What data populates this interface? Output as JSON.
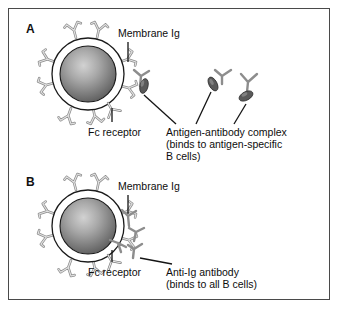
{
  "figure": {
    "background_color": "#ffffff",
    "frame_color": "#4a4a4a"
  },
  "colors": {
    "nucleus_center": "#c9c9c9",
    "nucleus_edge": "#5e5e5e",
    "membrane_ring": "#ffffff",
    "outline": "#1a1a1a",
    "antibody_fill": "#d9d9d9",
    "antibody_stroke": "#8a8a8a",
    "antigen_fill": "#555555",
    "text": "#0d0d0d"
  },
  "panels": [
    {
      "letter": "A",
      "cell": {
        "cx": 88,
        "cy": 74,
        "r_outer": 36,
        "r_nucleus": 28
      },
      "labels": [
        {
          "name": "membrane-ig",
          "text": "Membrane Ig",
          "x": 120,
          "y": 33
        },
        {
          "name": "fc-receptor",
          "text": "Fc receptor",
          "x": 92,
          "y": 129
        },
        {
          "name": "antigen-antibody-complex",
          "text": "Antigen-antibody complex\n(binds to antigen-specific\nB cells)",
          "x": 168,
          "y": 129
        }
      ]
    },
    {
      "letter": "B",
      "cell": {
        "cx": 88,
        "cy": 226,
        "r_outer": 36,
        "r_nucleus": 28
      },
      "labels": [
        {
          "name": "membrane-ig",
          "text": "Membrane Ig",
          "x": 120,
          "y": 186
        },
        {
          "name": "fc-receptor",
          "text": "Fc receptor",
          "x": 92,
          "y": 269
        },
        {
          "name": "anti-ig-antibody",
          "text": "Anti-Ig antibody\n(binds to all B cells)",
          "x": 168,
          "y": 269
        }
      ]
    }
  ],
  "panel_a_letter": "A",
  "panel_b_letter": "B",
  "text": {
    "membrane_ig": "Membrane Ig",
    "fc_receptor": "Fc receptor",
    "antigen_complex_line1": "Antigen-antibody complex",
    "antigen_complex_line2": "(binds to antigen-specific",
    "antigen_complex_line3": "B cells)",
    "anti_ig_line1": "Anti-Ig antibody",
    "anti_ig_line2": "(binds to all B cells)"
  }
}
